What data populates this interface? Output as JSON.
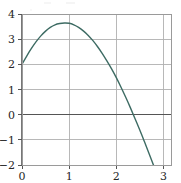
{
  "chart_data": {
    "type": "line",
    "title": "",
    "subtitle": "",
    "xlabel": "",
    "ylabel": "",
    "xlim": [
      0,
      3.16
    ],
    "ylim": [
      -2,
      4
    ],
    "xticks": [
      0,
      1,
      2,
      3
    ],
    "yticks": [
      -2,
      -1,
      0,
      1,
      2,
      3,
      4
    ],
    "xtick_labels": [
      "0",
      "1",
      "2",
      "3"
    ],
    "ytick_labels": [
      "−2",
      "−1",
      "0",
      "1",
      "2",
      "3",
      "4"
    ],
    "grid": true,
    "grid_color": "#b0b0b0",
    "zero_line": true,
    "zero_line_color": "#555555",
    "frame_color": "#9a9a9a",
    "background": "#ffffff",
    "legend": null,
    "series": [
      {
        "name": "curve",
        "color": "#3d6b63",
        "linewidth": 1.4,
        "x": [
          0.0,
          0.1,
          0.2,
          0.3,
          0.4,
          0.5,
          0.6,
          0.7,
          0.8,
          0.9,
          1.0,
          1.1,
          1.2,
          1.3,
          1.4,
          1.5,
          1.6,
          1.7,
          1.8,
          1.9,
          2.0,
          2.1,
          2.2,
          2.3,
          2.4,
          2.5,
          2.57,
          2.6,
          2.7,
          2.8,
          2.9,
          3.0,
          3.1,
          3.16
        ],
        "y": [
          2.0,
          2.33,
          2.63,
          2.9,
          3.13,
          3.32,
          3.47,
          3.57,
          3.62,
          3.64,
          3.63,
          3.57,
          3.47,
          3.33,
          3.16,
          2.95,
          2.71,
          2.44,
          2.14,
          1.82,
          1.47,
          1.09,
          0.69,
          0.27,
          -0.17,
          -0.62,
          -0.95,
          -1.09,
          -1.57,
          -2.06,
          -2.57,
          -3.08,
          -3.6,
          -3.92
        ]
      }
    ],
    "annotations": {
      "start_point": {
        "x": 0,
        "y": 2
      },
      "peak": {
        "x": 0.92,
        "y": 3.64
      },
      "zero_crossing": {
        "x": 2.57,
        "y": 0
      }
    }
  },
  "artifacts": {
    "top_smudge": "· ·"
  }
}
